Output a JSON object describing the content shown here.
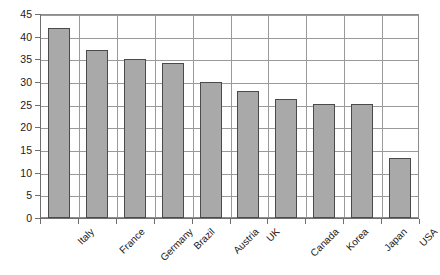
{
  "chart_data": {
    "type": "bar",
    "title": "",
    "subtitle": "",
    "xlabel": "",
    "ylabel": "",
    "categories": [
      "Italy",
      "France",
      "Germany",
      "Brazil",
      "Austria",
      "UK",
      "Canada",
      "Korea",
      "Japan",
      "USA"
    ],
    "values": [
      42.0,
      37.1,
      35.1,
      34.2,
      30.1,
      28.0,
      26.2,
      25.2,
      25.2,
      13.2
    ],
    "series": [
      {
        "name": "Series 1",
        "values": [
          42.0,
          37.1,
          35.1,
          34.2,
          30.1,
          28.0,
          26.2,
          25.2,
          25.2,
          13.2
        ]
      }
    ],
    "ylim": [
      0,
      45
    ],
    "ytick_step": 5,
    "yticks": [
      0,
      5,
      10,
      15,
      20,
      25,
      30,
      35,
      40,
      45
    ],
    "ytick_labels": [
      "0",
      "5",
      "10",
      "15",
      "20",
      "25",
      "30",
      "35",
      "40",
      "45"
    ],
    "grid": {
      "horizontal": true,
      "vertical": true,
      "color": "#9a9a9a"
    },
    "legend": {
      "visible": false,
      "position": "none",
      "entries": []
    },
    "colors": {
      "bar_fill": "#a9a9a9",
      "bar_border": "#4a4a4a",
      "axis": "#6f6f6f",
      "grid": "#9a9a9a",
      "text": "#1a1a1a",
      "background": "#ffffff"
    },
    "label_rotation_degrees": -45,
    "annotations": []
  }
}
